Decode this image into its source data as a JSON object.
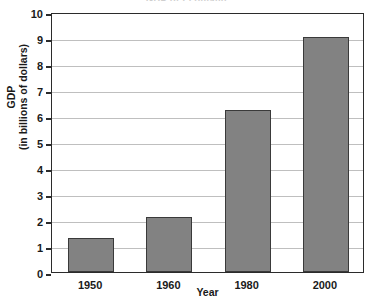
{
  "chart_data": {
    "type": "bar",
    "title": "GDP of Econland",
    "xlabel": "Year",
    "ylabel": "GDP\n(in billions of dollars)",
    "ylabel_lines": [
      "GDP",
      "(in billions of dollars)"
    ],
    "categories": [
      "1950",
      "1960",
      "1980",
      "2000"
    ],
    "values": [
      1.3,
      2.1,
      6.25,
      9.05
    ],
    "ylim": [
      0,
      10
    ],
    "ytick_labels": [
      "0",
      "1",
      "2",
      "3",
      "4",
      "5",
      "6",
      "7",
      "8",
      "9",
      "10"
    ],
    "ytick_values": [
      0,
      1,
      2,
      3,
      4,
      5,
      6,
      7,
      8,
      9,
      10
    ],
    "grid": true,
    "grid_axis": "y",
    "legend": false,
    "legend_position": "none",
    "bar_color": "#828282",
    "bar_edge_color": "#3a3a3a",
    "grid_color": "#bfbfbf",
    "axis_color": "#2b2b2b",
    "background": "#ffffff"
  }
}
